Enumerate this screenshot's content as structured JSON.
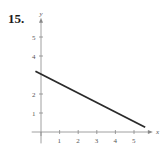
{
  "problem": {
    "number": "15."
  },
  "colors": {
    "axis": "#888888",
    "line": "#2a2a2a",
    "text": "#555555"
  },
  "chart_data": {
    "type": "line",
    "title": "",
    "xlabel": "x",
    "ylabel": "y",
    "x_ticks": [
      "1",
      "2",
      "3",
      "4",
      "5"
    ],
    "y_ticks": [
      "1",
      "2",
      "4",
      "5"
    ],
    "xlim": [
      -0.5,
      5.8
    ],
    "ylim": [
      -0.6,
      5.8
    ],
    "grid": false,
    "legend": null,
    "series": [
      {
        "name": "line",
        "x": [
          -0.3,
          5.6
        ],
        "y": [
          3.2,
          0.25
        ]
      }
    ]
  }
}
